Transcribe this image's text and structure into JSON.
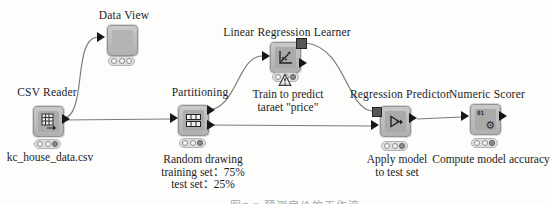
{
  "workflow": {
    "nodes": [
      {
        "id": "csv-reader",
        "title": "CSV Reader",
        "annotation_lines": [
          "kc_house_data.csv"
        ],
        "status_lights": [
          "off",
          "off",
          "on"
        ]
      },
      {
        "id": "data-view",
        "title": "Data View",
        "annotation_lines": [],
        "status_lights": [
          "off",
          "off",
          "off"
        ]
      },
      {
        "id": "partitioning",
        "title": "Partitioning",
        "annotation_lines": [
          "Random drawing",
          "training set：75%",
          "test set：25%"
        ],
        "status_lights": [
          "off",
          "off",
          "on"
        ]
      },
      {
        "id": "linear-regression-learner",
        "title": "Linear Regression Learner",
        "annotation_lines": [
          "Train to predict",
          "taraet \"price\""
        ],
        "status_lights": [
          "off",
          "warning",
          "on"
        ]
      },
      {
        "id": "regression-predictor",
        "title": "Regression Predictor",
        "annotation_lines": [
          "Apply model",
          "to test set"
        ],
        "status_lights": [
          "off",
          "off",
          "on"
        ]
      },
      {
        "id": "numeric-scorer",
        "title": "Numeric Scorer",
        "annotation_lines": [
          "Compute model accuracy"
        ],
        "status_lights": [
          "off",
          "off",
          "on"
        ]
      }
    ],
    "connections": [
      {
        "from": "csv-reader",
        "to": "data-view",
        "type": "data"
      },
      {
        "from": "csv-reader",
        "to": "partitioning",
        "type": "data"
      },
      {
        "from": "partitioning",
        "to": "linear-regression-learner",
        "type": "data"
      },
      {
        "from": "partitioning",
        "to": "regression-predictor",
        "type": "data"
      },
      {
        "from": "linear-regression-learner",
        "to": "regression-predictor",
        "type": "model"
      },
      {
        "from": "regression-predictor",
        "to": "numeric-scorer",
        "type": "data"
      }
    ],
    "numeric_scorer_icon_text": "01"
  },
  "caption_cropped": "图7-2 预测房价的工作流",
  "colors": {
    "background": "#fdfdfc",
    "node_body": "#bdbdbd",
    "port": "#171717",
    "model_port": "#565656",
    "light_on": "#8d8d8d",
    "wire": "#7c7c7c"
  }
}
